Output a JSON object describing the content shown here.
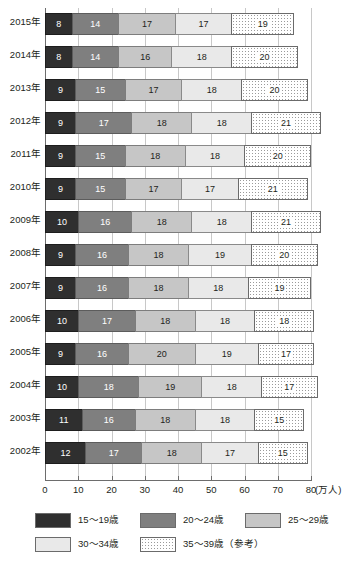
{
  "top_caption": "",
  "chart_data": {
    "type": "bar",
    "orientation": "horizontal",
    "stacked": true,
    "title": "",
    "xlabel": "",
    "ylabel": "",
    "unit_label": "(万人)",
    "xlim": [
      0,
      80
    ],
    "xticks": [
      0,
      10,
      20,
      30,
      40,
      50,
      60,
      70,
      80
    ],
    "xtick_labels": [
      "0",
      "10",
      "20",
      "30",
      "40",
      "50",
      "60",
      "70",
      "80"
    ],
    "grid": true,
    "legend_position": "bottom",
    "categories": [
      "2015年",
      "2014年",
      "2013年",
      "2012年",
      "2011年",
      "2010年",
      "2009年",
      "2008年",
      "2007年",
      "2006年",
      "2005年",
      "2004年",
      "2003年",
      "2002年"
    ],
    "series": [
      {
        "name": "15〜19歳",
        "color": "#2f2f2f",
        "pattern": "solid",
        "values": [
          8,
          8,
          9,
          9,
          9,
          9,
          10,
          9,
          9,
          10,
          9,
          10,
          11,
          12
        ]
      },
      {
        "name": "20〜24歳",
        "color": "#7f7f7f",
        "pattern": "solid",
        "values": [
          14,
          14,
          15,
          17,
          15,
          15,
          16,
          16,
          16,
          17,
          16,
          18,
          16,
          17
        ]
      },
      {
        "name": "25〜29歳",
        "color": "#c6c6c6",
        "pattern": "solid",
        "values": [
          17,
          16,
          17,
          18,
          18,
          17,
          18,
          18,
          18,
          18,
          20,
          19,
          18,
          18
        ]
      },
      {
        "name": "30〜34歳",
        "color": "#e9e9e9",
        "pattern": "solid",
        "values": [
          17,
          18,
          18,
          18,
          18,
          17,
          18,
          19,
          18,
          18,
          19,
          18,
          18,
          17
        ]
      },
      {
        "name": "35〜39歳（参考）",
        "color": "#ffffff",
        "pattern": "dotted",
        "values": [
          19,
          20,
          20,
          21,
          20,
          21,
          21,
          20,
          19,
          18,
          17,
          17,
          15,
          15
        ]
      }
    ],
    "totals": [
      75,
      76,
      79,
      83,
      80,
      79,
      83,
      82,
      80,
      81,
      81,
      82,
      78,
      79
    ]
  }
}
